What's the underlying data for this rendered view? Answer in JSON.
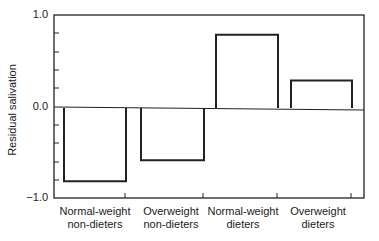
{
  "chart_data": {
    "type": "bar",
    "title": "",
    "xlabel": "",
    "ylabel": "Residual salivation",
    "ylim": [
      -1.0,
      1.0
    ],
    "yticks": [
      -1.0,
      0.0,
      1.0
    ],
    "minor_tick_step": 0.2,
    "grid": false,
    "legend": null,
    "categories": [
      "Normal-weight non-dieters",
      "Overweight non-dieters",
      "Normal-weight dieters",
      "Overweight dieters"
    ],
    "category_lines": [
      [
        "Normal-weight",
        "non-dieters"
      ],
      [
        "Overweight",
        "non-dieters"
      ],
      [
        "Normal-weight",
        "dieters"
      ],
      [
        "Overweight",
        "dieters"
      ]
    ],
    "values": [
      -0.8,
      -0.57,
      0.8,
      0.3
    ]
  },
  "axis": {
    "ylabel": "Residual salivation",
    "tick_labels": [
      "1.0",
      "0.0",
      "−1.0"
    ]
  },
  "labels": {
    "c0a": "Normal-weight",
    "c0b": "non-dieters",
    "c1a": "Overweight",
    "c1b": "non-dieters",
    "c2a": "Normal-weight",
    "c2b": "dieters",
    "c3a": "Overweight",
    "c3b": "dieters"
  }
}
